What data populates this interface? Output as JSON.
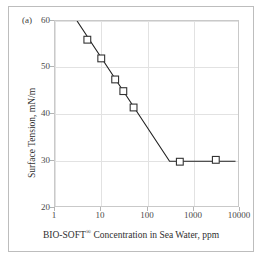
{
  "figure": {
    "panel_label": "(a)",
    "border_color": "#bdbdbd"
  },
  "axes": {
    "x_title_prefix": "BIO-SOFT",
    "x_title_registered": "®",
    "x_title_suffix": " Concentration in Sea Water, ppm",
    "x_title_full": "BIO-SOFT® Concentration in Sea Water, ppm",
    "y_title": "Surface Tension, mN/m",
    "x_ticks": [
      "1",
      "10",
      "100",
      "1000",
      "10000"
    ],
    "y_ticks": [
      "60",
      "50",
      "40",
      "30",
      "20"
    ],
    "grid_color": "#e2e2e2",
    "frame_color": "#c9c9c9",
    "tick_label_color": "#4a4a4a"
  },
  "chart_data": {
    "type": "line",
    "title": "",
    "subtitle": "(a)",
    "xlabel": "BIO-SOFT® Concentration in Sea Water, ppm",
    "ylabel": "Surface Tension, mN/m",
    "xscale": "log",
    "yscale": "linear",
    "xlim": [
      1,
      10000
    ],
    "ylim": [
      20,
      60
    ],
    "xticks": [
      1,
      10,
      100,
      1000,
      10000
    ],
    "yticks": [
      20,
      30,
      40,
      50,
      60
    ],
    "grid": true,
    "legend": "none",
    "series": [
      {
        "name": "Surface tension vs BIO-SOFT concentration",
        "marker": "open-square",
        "marker_edge_color": "#333333",
        "line_color": "#222222",
        "points": [
          {
            "x": 5,
            "y": 56.0
          },
          {
            "x": 10,
            "y": 52.0
          },
          {
            "x": 20,
            "y": 47.5
          },
          {
            "x": 30,
            "y": 45.0
          },
          {
            "x": 50,
            "y": 41.5
          },
          {
            "x": 500,
            "y": 29.9
          },
          {
            "x": 3000,
            "y": 30.3
          }
        ],
        "fit_line": {
          "description": "two-segment fit: descending branch then CMC plateau",
          "vertices": [
            {
              "x": 3,
              "y": 60.0
            },
            {
              "x": 300,
              "y": 30.0
            },
            {
              "x": 8000,
              "y": 30.0
            }
          ],
          "cmc_breakpoint": {
            "x": 300,
            "y": 30.0
          }
        }
      }
    ]
  }
}
